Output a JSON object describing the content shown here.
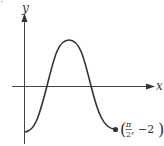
{
  "diagram": {
    "type": "function-graph",
    "axes": {
      "x_label": "x",
      "y_label": "y"
    },
    "curve": {
      "description": "One cosine-like period starting at a minimum on the y-axis, rising to a maximum, and falling to an endpoint minimum",
      "color": "#333333"
    },
    "endpoint": {
      "label_open": "(",
      "frac_num": "π",
      "frac_den": "2",
      "label_rest": ", −2",
      "label_close": ")",
      "x": "π/2",
      "y": "-2"
    },
    "corner_mark": "·"
  }
}
